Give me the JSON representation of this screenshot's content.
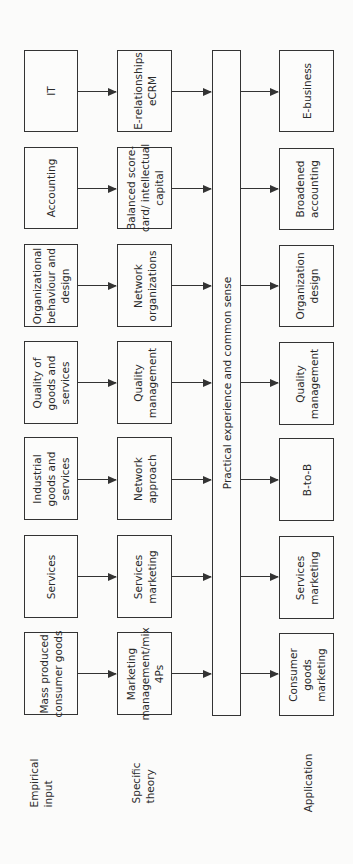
{
  "stages": {
    "empirical": "Empirical\ninput",
    "theory": "Specific\ntheory",
    "application": "Application"
  },
  "central_bar": "Practical experience and common sense",
  "rows": [
    {
      "empirical": "IT",
      "theory": "E-relationships\neCRM",
      "application": "E-business"
    },
    {
      "empirical": "Accounting",
      "theory": "Balanced score-\ncard/ intellectual\ncapital",
      "application": "Broadened\naccounting"
    },
    {
      "empirical": "Organizational\nbehaviour and\ndesign",
      "theory": "Network\norganizations",
      "application": "Organization\ndesign"
    },
    {
      "empirical": "Quality of\ngoods and\nservices",
      "theory": "Quality\nmanagement",
      "application": "Quality\nmanagement"
    },
    {
      "empirical": "Industrial\ngoods and\nservices",
      "theory": "Network\napproach",
      "application": "B-to-B"
    },
    {
      "empirical": "Services",
      "theory": "Services\nmarketing",
      "application": "Services\nmarketing"
    },
    {
      "empirical": "Mass produced\nconsumer goods",
      "theory": "Marketing\nmanagement/mix\n4Ps",
      "application": "Consumer\ngoods\nmarketing"
    }
  ]
}
